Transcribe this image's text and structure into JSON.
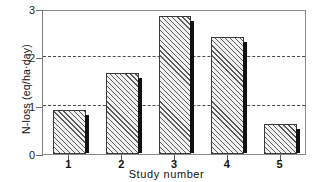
{
  "chart_data": {
    "type": "bar",
    "title": "",
    "xlabel": "Study number",
    "ylabel": "N-loss (eq/ha·day)",
    "categories": [
      "1",
      "2",
      "3",
      "4",
      "5"
    ],
    "values": [
      0.92,
      1.68,
      2.85,
      2.42,
      0.62
    ],
    "ylim": [
      0,
      3
    ],
    "yticks": [
      "0",
      "1",
      "2",
      "3"
    ],
    "ytick_values": [
      0,
      1,
      2,
      3
    ],
    "gridlines": [
      1,
      2
    ],
    "grid": "horizontal-dashed-at-1-and-2",
    "legend": "none",
    "series": [
      {
        "name": "N-loss",
        "values": [
          0.92,
          1.68,
          2.85,
          2.42,
          0.62
        ]
      }
    ],
    "style": {
      "bar_fill": "#f2f2f2",
      "bar_hatch": "diagonal-forward-slash",
      "bar_hatch_color": "#5a5a5a",
      "bar_edge": "#3a3a3a",
      "bar_shadow": "#111111",
      "grid_color": "#4a4a4a",
      "frame_color": "#8a8a8a",
      "background": "#ffffff"
    }
  }
}
